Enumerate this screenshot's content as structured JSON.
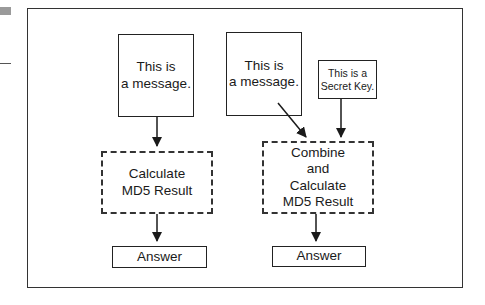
{
  "diagram": {
    "left_flow": {
      "message": "This is\na message.",
      "process": "Calculate\nMD5  Result",
      "output": "Answer"
    },
    "right_flow": {
      "message": "This is\na message.",
      "key": "This is a\nSecret Key.",
      "process": "Combine\nand\nCalculate\nMD5  Result",
      "output": "Answer"
    },
    "edges": [
      {
        "from": "left-message",
        "to": "left-process"
      },
      {
        "from": "left-process",
        "to": "left-answer"
      },
      {
        "from": "right-message",
        "to": "right-process"
      },
      {
        "from": "secret-key",
        "to": "right-process"
      },
      {
        "from": "right-process",
        "to": "right-answer"
      }
    ],
    "colors": {
      "stroke": "#222222",
      "background": "#ffffff",
      "edge_mark": "#9a9a9a"
    }
  }
}
